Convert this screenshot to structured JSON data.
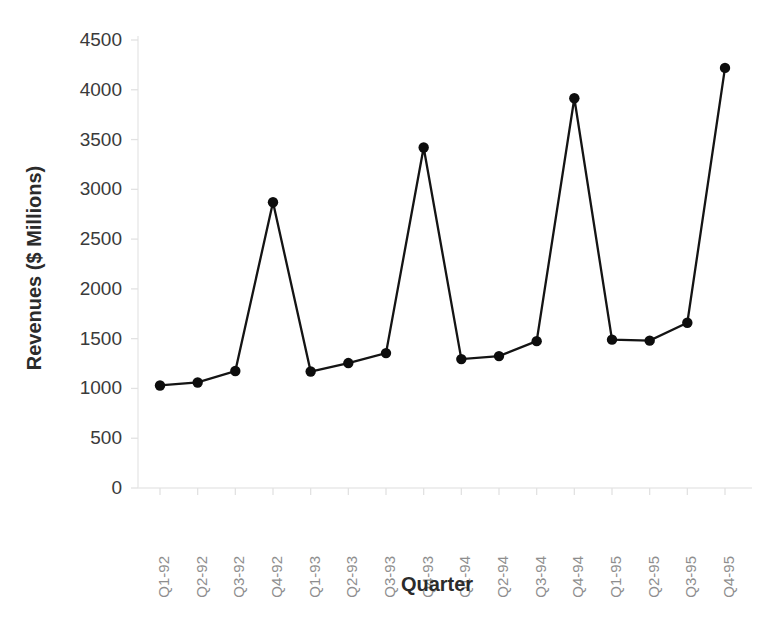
{
  "chart_data": {
    "type": "line",
    "title": "",
    "subtitle": "",
    "xlabel": "Quarter",
    "ylabel": "Revenues ($ Millions)",
    "categories": [
      "Q1-92",
      "Q2-92",
      "Q3-92",
      "Q4-92",
      "Q1-93",
      "Q2-93",
      "Q3-93",
      "Q4-93",
      "Q1-94",
      "Q2-94",
      "Q3-94",
      "Q4-94",
      "Q1-95",
      "Q2-95",
      "Q3-95",
      "Q4-95"
    ],
    "values": [
      1030,
      1060,
      1175,
      2870,
      1170,
      1255,
      1355,
      3420,
      1295,
      1325,
      1475,
      3915,
      1490,
      1480,
      1660,
      4220
    ],
    "series": [
      {
        "name": "Revenues",
        "values": [
          1030,
          1060,
          1175,
          2870,
          1170,
          1255,
          1355,
          3420,
          1295,
          1325,
          1475,
          3915,
          1490,
          1480,
          1660,
          4220
        ]
      }
    ],
    "ylim": [
      0,
      4500
    ],
    "yticks": [
      0,
      500,
      1000,
      1500,
      2000,
      2500,
      3000,
      3500,
      4000,
      4500
    ],
    "ytick_labels": [
      "0",
      "500",
      "1000",
      "1500",
      "2000",
      "2500",
      "3000",
      "3500",
      "4000",
      "4500"
    ],
    "grid": false,
    "legend": false,
    "legend_position": "none",
    "marker": "circle",
    "line_color": "#141414",
    "marker_color": "#0d0d0d",
    "background_color": "#ffffff",
    "xtick_rotation": 90,
    "annotations": []
  },
  "axes": {
    "x_title": "Quarter",
    "y_title": "Revenues ($ Millions)"
  }
}
